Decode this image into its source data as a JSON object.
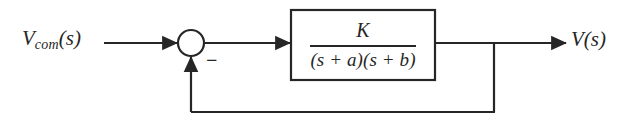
{
  "diagram": {
    "type": "control-system-block-diagram",
    "background_color": "#ffffff",
    "line_color": "#262626",
    "text_color": "#262626",
    "input": {
      "label_variable": "V",
      "label_subscript": "com",
      "label_argument": "(s)",
      "label_full": "V_com(s)"
    },
    "summing_junction": {
      "name": "summing-junction",
      "sign_positive": "+",
      "sign_negative": "−",
      "feedback_sign_label": "−",
      "center_x": 191,
      "center_y": 43,
      "radius": 13
    },
    "plant_block": {
      "name": "transfer-function-block",
      "numerator": "K",
      "denominator": "(s + a)(s + b)",
      "transfer_function": "K/((s + a)(s + b))",
      "x": 291,
      "y": 10,
      "width": 144,
      "height": 70
    },
    "output": {
      "label_variable": "V",
      "label_argument": "(s)",
      "label_full": "V(s)"
    },
    "feedback_path": {
      "name": "unity-feedback-path",
      "gain": "1",
      "takeoff_x": 494,
      "bottom_y": 112,
      "return_x": 191
    },
    "signal_line_y": 43
  }
}
